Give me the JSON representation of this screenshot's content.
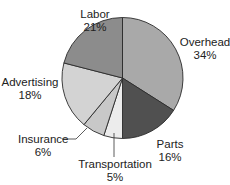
{
  "chart_data": {
    "type": "pie",
    "title": "",
    "start_angle_deg": 0,
    "direction": "clockwise",
    "categories": [
      "Overhead",
      "Parts",
      "Transportation",
      "Insurance",
      "Advertising",
      "Labor"
    ],
    "values": [
      34,
      16,
      5,
      6,
      18,
      21
    ],
    "unit": "%",
    "colors": [
      "#a9a9a9",
      "#505050",
      "#ececec",
      "#c8c8c8",
      "#d3d3d3",
      "#8c8c8c"
    ],
    "labels": [
      {
        "name": "Overhead",
        "pct": "34%"
      },
      {
        "name": "Parts",
        "pct": "16%"
      },
      {
        "name": "Transportation",
        "pct": "5%"
      },
      {
        "name": "Insurance",
        "pct": "6%"
      },
      {
        "name": "Advertising",
        "pct": "18%"
      },
      {
        "name": "Labor",
        "pct": "21%"
      }
    ],
    "legend": "none (direct labels)"
  }
}
